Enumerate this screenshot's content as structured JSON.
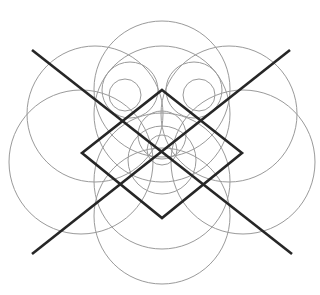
{
  "figure": {
    "colors": {
      "background": "#ffffff",
      "circle_stroke": "#9a9a9a",
      "bold_stroke": "#262626"
    },
    "circles": [
      {
        "cx": 162,
        "cy": 89,
        "r": 68
      },
      {
        "cx": 162,
        "cy": 114,
        "r": 68
      },
      {
        "cx": 95,
        "cy": 114,
        "r": 68
      },
      {
        "cx": 229,
        "cy": 114,
        "r": 68
      },
      {
        "cx": 81,
        "cy": 162,
        "r": 72
      },
      {
        "cx": 243,
        "cy": 162,
        "r": 72
      },
      {
        "cx": 162,
        "cy": 181,
        "r": 68
      },
      {
        "cx": 162,
        "cy": 216,
        "r": 68
      },
      {
        "cx": 130,
        "cy": 90,
        "r": 28
      },
      {
        "cx": 194,
        "cy": 90,
        "r": 28
      },
      {
        "cx": 125,
        "cy": 95,
        "r": 16
      },
      {
        "cx": 199,
        "cy": 95,
        "r": 16
      },
      {
        "cx": 162,
        "cy": 135,
        "r": 24
      },
      {
        "cx": 162,
        "cy": 150,
        "r": 15
      },
      {
        "cx": 162,
        "cy": 160,
        "r": 34
      }
    ],
    "diamond": {
      "top": [
        162,
        90
      ],
      "right": [
        242,
        153
      ],
      "bottom": [
        162,
        218
      ],
      "left": [
        82,
        153
      ]
    },
    "x_lines": [
      {
        "x1": 32,
        "y1": 50,
        "x2": 292,
        "y2": 254
      },
      {
        "x1": 290,
        "y1": 50,
        "x2": 32,
        "y2": 254
      }
    ]
  }
}
